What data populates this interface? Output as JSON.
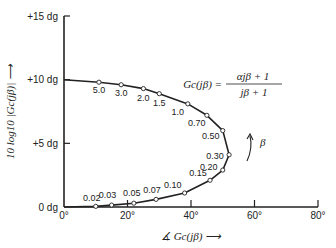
{
  "chart_data": {
    "type": "line",
    "title": "",
    "xlabel": "∡ Gc(jβ) →",
    "ylabel": "10 log10 |Gc(jβ)| →",
    "xlim": [
      0,
      80
    ],
    "ylim": [
      0,
      15
    ],
    "x_ticks": [
      "0°",
      "20°",
      "40°",
      "60°",
      "80°"
    ],
    "y_ticks": [
      "0 dg",
      "+5 dg",
      "+10 dg",
      "+15 dg"
    ],
    "grid": false,
    "annotation_formula": "Gc(jβ) = (αjβ + 1)/(jβ + 1)",
    "annotation_arrow": "β",
    "series": [
      {
        "name": "Gc(jβ) locus, α = 10",
        "points": [
          {
            "beta": "5.0",
            "phase_deg": 11,
            "db": 9.8
          },
          {
            "beta": "3.0",
            "phase_deg": 18,
            "db": 9.6
          },
          {
            "beta": "2.0",
            "phase_deg": 25,
            "db": 9.3
          },
          {
            "beta": "1.5",
            "phase_deg": 30,
            "db": 8.9
          },
          {
            "beta": "1.0",
            "phase_deg": 39,
            "db": 8.1
          },
          {
            "beta": "0.70",
            "phase_deg": 45,
            "db": 7.2
          },
          {
            "beta": "0.50",
            "phase_deg": 50,
            "db": 6.0
          },
          {
            "beta": "0.30",
            "phase_deg": 52,
            "db": 4.1
          },
          {
            "beta": "0.20",
            "phase_deg": 50,
            "db": 2.9
          },
          {
            "beta": "0.15",
            "phase_deg": 46,
            "db": 2.1
          },
          {
            "beta": "0.10",
            "phase_deg": 38,
            "db": 1.1
          },
          {
            "beta": "0.07",
            "phase_deg": 29,
            "db": 0.6
          },
          {
            "beta": "0.05",
            "phase_deg": 22,
            "db": 0.3
          },
          {
            "beta": "0.03",
            "phase_deg": 15,
            "db": 0.15
          },
          {
            "beta": "0.02",
            "phase_deg": 10,
            "db": 0.05
          }
        ]
      }
    ]
  },
  "labels": {
    "x_axis": "∡ Gc(jβ) ⟶",
    "y_axis": "10 log10 |Gc(jβ)| ⟶",
    "formula_lhs": "Gc(jβ) =",
    "formula_num": "αjβ + 1",
    "formula_den": "jβ + 1",
    "beta_arrow": "β"
  }
}
